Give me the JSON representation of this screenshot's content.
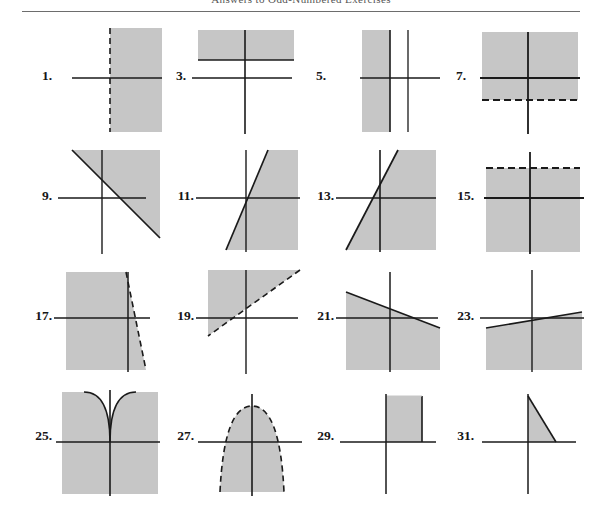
{
  "page": {
    "header_title": "Answers to Odd-Numbered Exercises",
    "rule_color": "#6d6d6d",
    "shade_color": "#c6c6c6",
    "axis_color": "#1a1a1a",
    "boundary_color": "#1a1a1a",
    "width": 602,
    "height": 508
  },
  "figures": [
    {
      "number": "1.",
      "description": "Vertical dashed boundary line with shaded half-plane to the right; horizontal axis drawn through region",
      "boundary_style": "dashed",
      "boundary_orientation": "vertical",
      "shaded_side": "right",
      "axes": [
        "x-axis"
      ],
      "row": 1,
      "col": 1
    },
    {
      "number": "3.",
      "description": "Horizontal solid boundary line above the x-axis with shaded band above it; x-axis and y-axis shown",
      "boundary_style": "solid",
      "boundary_orientation": "horizontal",
      "shaded_side": "above",
      "axes": [
        "x-axis",
        "y-axis"
      ],
      "row": 1,
      "col": 2
    },
    {
      "number": "5.",
      "description": "Vertical solid boundary line left of the y-axis with shaded band to its left; x-axis and y-axis shown",
      "boundary_style": "solid",
      "boundary_orientation": "vertical",
      "shaded_side": "left",
      "axes": [
        "x-axis",
        "y-axis"
      ],
      "row": 1,
      "col": 3
    },
    {
      "number": "7.",
      "description": "Horizontal dashed boundary line below the x-axis with shaded region above it; x-axis and y-axis shown",
      "boundary_style": "dashed",
      "boundary_orientation": "horizontal",
      "shaded_side": "above",
      "axes": [
        "x-axis",
        "y-axis"
      ],
      "row": 1,
      "col": 4
    },
    {
      "number": "9.",
      "description": "Solid line with negative slope; region above and right of the line shaded",
      "boundary_style": "solid",
      "boundary_orientation": "negative-slope",
      "shaded_side": "above-right",
      "axes": [
        "x-axis",
        "y-axis"
      ],
      "row": 2,
      "col": 1
    },
    {
      "number": "11.",
      "description": "Steep solid line with positive slope; region to the right of the line shaded",
      "boundary_style": "solid",
      "boundary_orientation": "steep-positive-slope",
      "shaded_side": "right",
      "axes": [
        "x-axis",
        "y-axis"
      ],
      "row": 2,
      "col": 2
    },
    {
      "number": "13.",
      "description": "Solid line with positive slope through the origin region; area to the right shaded",
      "boundary_style": "solid",
      "boundary_orientation": "positive-slope",
      "shaded_side": "right",
      "axes": [
        "x-axis",
        "y-axis"
      ],
      "row": 2,
      "col": 3
    },
    {
      "number": "15.",
      "description": "Horizontal dashed boundary line above the x-axis with shaded region below it; x-axis and y-axis shown",
      "boundary_style": "dashed",
      "boundary_orientation": "horizontal",
      "shaded_side": "below",
      "axes": [
        "x-axis",
        "y-axis"
      ],
      "row": 2,
      "col": 4
    },
    {
      "number": "17.",
      "description": "Steep dashed line with negative slope; region to the left shaded",
      "boundary_style": "dashed",
      "boundary_orientation": "steep-negative-slope",
      "shaded_side": "left",
      "axes": [
        "x-axis",
        "y-axis"
      ],
      "row": 3,
      "col": 1
    },
    {
      "number": "19.",
      "description": "Dashed line with positive slope; region above and left of the line shaded",
      "boundary_style": "dashed",
      "boundary_orientation": "positive-slope",
      "shaded_side": "above-left",
      "axes": [
        "x-axis",
        "y-axis"
      ],
      "row": 3,
      "col": 2
    },
    {
      "number": "21.",
      "description": "Solid line with shallow negative slope; region below the line shaded",
      "boundary_style": "solid",
      "boundary_orientation": "shallow-negative-slope",
      "shaded_side": "below",
      "axes": [
        "x-axis",
        "y-axis"
      ],
      "row": 3,
      "col": 3
    },
    {
      "number": "23.",
      "description": "Solid line with shallow positive slope; region below the line shaded",
      "boundary_style": "solid",
      "boundary_orientation": "shallow-positive-slope",
      "shaded_side": "below",
      "axes": [
        "x-axis",
        "y-axis"
      ],
      "row": 3,
      "col": 4
    },
    {
      "number": "25.",
      "description": "Upward-opening parabola with vertex at the origin; region below and outside the parabola shaded",
      "boundary_style": "solid",
      "boundary_orientation": "parabola-up",
      "shaded_side": "outside-below",
      "axes": [
        "x-axis",
        "y-axis"
      ],
      "row": 4,
      "col": 1
    },
    {
      "number": "27.",
      "description": "Downward-opening dashed parabola with vertex above the x-axis; interior region shaded",
      "boundary_style": "dashed",
      "boundary_orientation": "parabola-down",
      "shaded_side": "inside",
      "axes": [
        "x-axis",
        "y-axis"
      ],
      "row": 4,
      "col": 2
    },
    {
      "number": "29.",
      "description": "Shaded rectangle in the first quadrant bounded by the y-axis, x-axis and a vertical line",
      "boundary_style": "solid",
      "boundary_orientation": "rectangle",
      "shaded_side": "inside",
      "axes": [
        "x-axis",
        "y-axis"
      ],
      "row": 4,
      "col": 3
    },
    {
      "number": "31.",
      "description": "Shaded right triangle in the first quadrant bounded by the y-axis, x-axis and a negative-slope line",
      "boundary_style": "solid",
      "boundary_orientation": "triangle",
      "shaded_side": "inside",
      "axes": [
        "x-axis",
        "y-axis"
      ],
      "row": 4,
      "col": 4
    }
  ]
}
